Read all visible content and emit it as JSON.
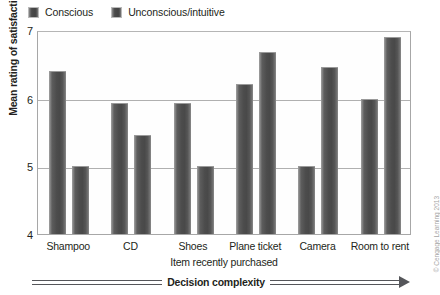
{
  "legend": {
    "position": "top-left",
    "entries": [
      {
        "label": "Conscious",
        "swatch_icon": "legend-swatch-icon",
        "color": "#4a4a4a"
      },
      {
        "label": "Unconscious/intuitive",
        "swatch_icon": "legend-swatch-icon",
        "color": "#4a4a4a"
      }
    ]
  },
  "axes": {
    "y_title": "Mean rating of satisfaction",
    "y_ticks": [
      "7",
      "6",
      "5",
      "4"
    ],
    "x_title": "Item recently purchased"
  },
  "annotation": {
    "complexity_label": "Decision complexity",
    "arrow_icon": "right-arrow-icon"
  },
  "credit": "© Cengage Learning 2013",
  "chart_data": {
    "type": "bar",
    "title": "",
    "xlabel": "Item recently purchased",
    "ylabel": "Mean rating of satisfaction",
    "ylim": [
      4,
      7
    ],
    "yticks": [
      4,
      5,
      6,
      7
    ],
    "grid": true,
    "legend_position": "top-left",
    "categories": [
      "Shampoo",
      "CD",
      "Shoes",
      "Plane ticket",
      "Camera",
      "Room to rent"
    ],
    "series": [
      {
        "name": "Conscious",
        "values": [
          6.4,
          5.92,
          5.92,
          6.2,
          5.0,
          5.98
        ]
      },
      {
        "name": "Unconscious/intuitive",
        "values": [
          5.0,
          5.45,
          5.0,
          6.67,
          6.45,
          6.9
        ]
      }
    ],
    "annotations": [
      {
        "text": "Decision complexity",
        "type": "arrow",
        "direction": "right",
        "position": "below-x-axis"
      }
    ]
  }
}
